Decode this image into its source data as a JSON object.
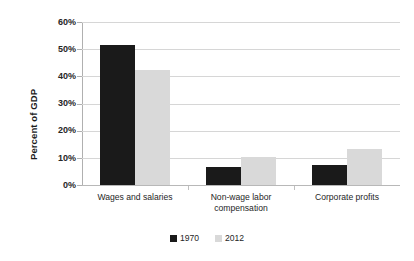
{
  "chart_data": {
    "type": "bar",
    "title": "",
    "subtitle": "",
    "xlabel": "",
    "ylabel": "Percent of GDP",
    "categories": [
      "Wages and salaries",
      "Non-wage labor compensation",
      "Corporate profits"
    ],
    "category_lines": [
      [
        "Wages and salaries"
      ],
      [
        "Non-wage labor",
        "compensation"
      ],
      [
        "Corporate profits"
      ]
    ],
    "series": [
      {
        "name": "1970",
        "color": "#1a1a1a",
        "values": [
          51.5,
          6.8,
          7.4
        ]
      },
      {
        "name": "2012",
        "color": "#d9d9d9",
        "values": [
          42.3,
          10.3,
          13.4
        ]
      }
    ],
    "ylim": [
      0,
      60
    ],
    "yticks": [
      0,
      10,
      20,
      30,
      40,
      50,
      60
    ],
    "ytick_labels": [
      "0%",
      "10%",
      "20%",
      "30%",
      "40%",
      "50%",
      "60%"
    ],
    "grid": true,
    "grid_axis": "y",
    "legend_position": "bottom",
    "legend_entries": [
      "1970",
      "2012"
    ]
  },
  "axis": {
    "y_title": "Percent of GDP",
    "tick_0": "0%",
    "tick_10": "10%",
    "tick_20": "20%",
    "tick_30": "30%",
    "tick_40": "40%",
    "tick_50": "50%",
    "tick_60": "60%"
  },
  "categories": {
    "cat0_line0": "Wages and salaries",
    "cat1_line0": "Non-wage labor",
    "cat1_line1": "compensation",
    "cat2_line0": "Corporate profits"
  },
  "legend": {
    "item0": "1970",
    "item1": "2012"
  },
  "colors": {
    "series_1970": "#1a1a1a",
    "series_2012": "#d9d9d9",
    "gridline": "#d6d6d6",
    "axis": "#b0b0b0",
    "background": "#ffffff",
    "text": "#262626"
  }
}
